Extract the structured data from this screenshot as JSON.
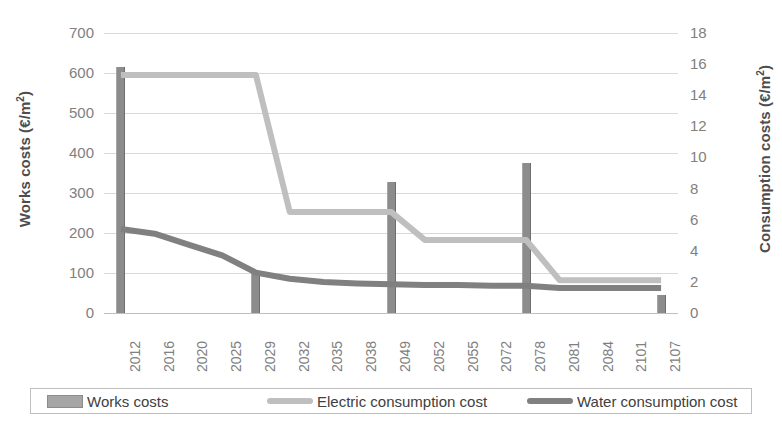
{
  "chart_data": {
    "type": "bar",
    "title": "",
    "categories": [
      "2012",
      "2016",
      "2020",
      "2025",
      "2029",
      "2032",
      "2035",
      "2038",
      "2049",
      "2052",
      "2055",
      "2072",
      "2078",
      "2081",
      "2084",
      "2101",
      "2107"
    ],
    "series": [
      {
        "name": "Works costs",
        "type": "bar",
        "axis": "left",
        "color": "#8c8c8c",
        "values": [
          615,
          0,
          0,
          0,
          100,
          0,
          0,
          0,
          328,
          0,
          0,
          0,
          375,
          0,
          0,
          0,
          45
        ]
      },
      {
        "name": "Electric consumption cost",
        "type": "line",
        "axis": "right",
        "color": "#bfbfbf",
        "values": [
          15.3,
          15.3,
          15.3,
          15.3,
          15.3,
          6.5,
          6.5,
          6.5,
          6.5,
          4.7,
          4.7,
          4.7,
          4.7,
          2.1,
          2.1,
          2.1,
          2.1
        ]
      },
      {
        "name": "Water consumption cost",
        "type": "line",
        "axis": "right",
        "color": "#808080",
        "values": [
          5.4,
          5.1,
          4.4,
          3.7,
          2.6,
          2.2,
          2.0,
          1.9,
          1.85,
          1.8,
          1.8,
          1.75,
          1.75,
          1.6,
          1.6,
          1.6,
          1.6
        ]
      }
    ],
    "left_axis": {
      "label_prefix": "Works costs (€/m",
      "label_sup": "2",
      "label_suffix": ")",
      "ticks": [
        "700",
        "600",
        "500",
        "400",
        "300",
        "200",
        "100",
        "0"
      ],
      "min": 0,
      "max": 700,
      "step": 100
    },
    "right_axis": {
      "label_prefix": "Consumption costs (€/m",
      "label_sup": "2",
      "label_suffix": ")",
      "ticks": [
        "18",
        "16",
        "14",
        "12",
        "10",
        "8",
        "6",
        "4",
        "2",
        "0"
      ],
      "min": 0,
      "max": 18,
      "step": 2
    },
    "xlabel": "",
    "grid": true,
    "legend": {
      "position": "bottom",
      "entries": [
        {
          "label": "Works costs",
          "marker": "bar",
          "color": "#a6a6a6"
        },
        {
          "label": "Electric consumption cost",
          "marker": "line",
          "color": "#bfbfbf"
        },
        {
          "label": "Water consumption cost",
          "marker": "line",
          "color": "#808080"
        }
      ]
    }
  }
}
